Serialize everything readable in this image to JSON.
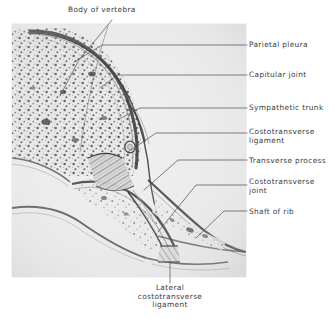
{
  "figure": {
    "kind": "anatomical-photomicrograph",
    "panel": {
      "background_color": "#ededed",
      "border_color": "#d8d8d8",
      "x": 12,
      "y": 24,
      "width": 234,
      "height": 253
    },
    "colors": {
      "label_text": "#3b3b3b",
      "leader_line": "#555555",
      "bone_dark": "#4a4a4a",
      "bone_mid": "#9a9a9a",
      "bone_light": "#e2e2e2",
      "page_background": "#ffffff"
    }
  },
  "labels": {
    "top": {
      "id": "body-of-vertebra",
      "text": "Body of vertebra",
      "x": 68,
      "y": 8,
      "align": "left"
    },
    "right": [
      {
        "id": "parietal-pleura",
        "text": "Parietal pleura",
        "x": 249,
        "y": 41,
        "lines": [
          "Parietal pleura"
        ]
      },
      {
        "id": "capitular-joint",
        "text": "Capitular joint",
        "x": 249,
        "y": 71,
        "lines": [
          "Capitular joint"
        ]
      },
      {
        "id": "sympathetic-trunk",
        "text": "Sympathetic trunk",
        "x": 249,
        "y": 104,
        "lines": [
          "Sympathetic trunk"
        ]
      },
      {
        "id": "costotransverse-ligament",
        "text": "Costotransverse ligament",
        "x": 249,
        "y": 128,
        "lines": [
          "Costotransverse",
          "ligament"
        ]
      },
      {
        "id": "transverse-process",
        "text": "Transverse process",
        "x": 249,
        "y": 157,
        "lines": [
          "Transverse process"
        ]
      },
      {
        "id": "costotransverse-joint",
        "text": "Costotransverse joint",
        "x": 249,
        "y": 178,
        "lines": [
          "Costotransverse",
          "joint"
        ]
      },
      {
        "id": "shaft-of-rib",
        "text": "Shaft of rib",
        "x": 249,
        "y": 208,
        "lines": [
          "Shaft of rib"
        ]
      }
    ],
    "bottom": {
      "id": "lateral-costotransverse-ligament",
      "text": "Lateral costotransverse ligament",
      "lines": [
        "Lateral",
        "costotransverse",
        "ligament"
      ],
      "x": 170,
      "y": 286,
      "align": "center"
    }
  },
  "leaders": {
    "body_of_vertebra": "M 112 20 L 79 60 L 60 96",
    "parietal_pleura": "M 247 45 L 102 45 L 74 62",
    "capitular_joint": "M 247 75 L 118 75 L 100 88",
    "sympathetic_trunk": "M 247 108 L 140 108 L 121 118",
    "costotransverse_ligament": "M 247 133 L 156 133 L 128 152",
    "transverse_process": "M 247 160 L 178 160 L 144 190",
    "costotransverse_joint": "M 247 185 L 196 185 L 158 232",
    "shaft_of_rib": "M 247 211 L 224 211 L 196 238",
    "lateral_costotransverse_ligament": "M 170 283 L 170 262"
  }
}
